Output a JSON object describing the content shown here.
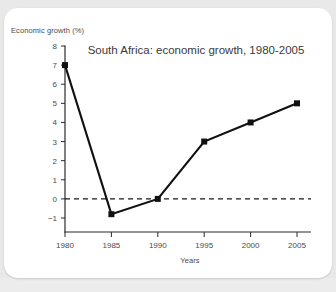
{
  "figure": {
    "ylabel_caption": "Economic growth (%)",
    "xlabel_caption": "Years",
    "title": "South Africa: economic growth, 1980-2005"
  },
  "chart_data": {
    "type": "line",
    "title": "South Africa: economic growth, 1980-2005",
    "xlabel": "Years",
    "ylabel": "Economic growth (%)",
    "x": [
      1980,
      1985,
      1990,
      1995,
      2000,
      2005
    ],
    "categories": [
      "1980",
      "1985",
      "1990",
      "1995",
      "2000",
      "2005"
    ],
    "values": [
      7,
      -0.8,
      0,
      3,
      4,
      5
    ],
    "series": [
      {
        "name": "Economic growth (%)",
        "values": [
          7,
          -0.8,
          0,
          3,
          4,
          5
        ]
      }
    ],
    "xlim": [
      1980,
      2005
    ],
    "ylim": [
      -1,
      8
    ],
    "ytick_labels": [
      "8",
      "7",
      "6",
      "5",
      "4",
      "3",
      "2",
      "1",
      "0",
      "−1"
    ],
    "ytick_values": [
      8,
      7,
      6,
      5,
      4,
      3,
      2,
      1,
      0,
      -1
    ],
    "xtick_labels": [
      "1980",
      "1985",
      "1990",
      "1995",
      "2000",
      "2005"
    ],
    "grid": false,
    "legend": "none",
    "annotations": [
      {
        "type": "reference-line",
        "value": 0,
        "style": "dashed",
        "orientation": "horizontal"
      }
    ],
    "marker": "square",
    "line_color": "#111111",
    "marker_color": "#111111"
  }
}
